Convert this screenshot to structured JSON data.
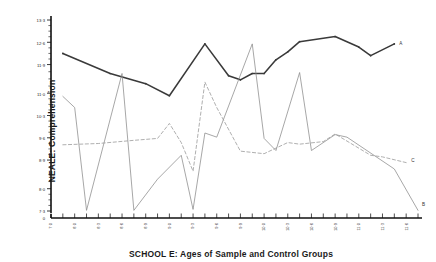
{
  "chart_data": {
    "type": "line",
    "title": "",
    "xlabel": "SCHOOL E: Ages of Sample and Control Groups",
    "ylabel": "NEALE: Comprehension",
    "grid": false,
    "legend_position": "line-end-labels",
    "ylim": [
      7.3,
      13.3
    ],
    "y_break_label": "0",
    "yticks": [
      7.3,
      8.0,
      8.9,
      9.6,
      10.3,
      11.0,
      11.9,
      12.6,
      13.3
    ],
    "ytick_labels": [
      "7·3",
      "8·0",
      "8·9",
      "9·6",
      "10·3",
      "11·0",
      "11·9",
      "12·6",
      "13·3"
    ],
    "y_minor_count": 3,
    "xticks": [
      7.0,
      8.0,
      8.3,
      8.6,
      8.9,
      9.0,
      9.3,
      9.6,
      9.9,
      10.0,
      10.3,
      10.6,
      10.9,
      11.0,
      11.3,
      11.6
    ],
    "xtick_labels": [
      "7·0",
      "8·0",
      "8·3",
      "8·6",
      "8·9",
      "9·0",
      "9·3",
      "9·6",
      "9·9",
      "10·0",
      "10·3",
      "10·6",
      "10·9",
      "11·0",
      "11·3",
      "11·6"
    ],
    "x_index_range": [
      0,
      31
    ],
    "series": [
      {
        "name": "A",
        "label": "A",
        "style": "solid-thick",
        "color": "#3a3a3a",
        "markers": true,
        "points": [
          {
            "i": 1,
            "y": 12.25
          },
          {
            "i": 5,
            "y": 11.62
          },
          {
            "i": 8,
            "y": 11.3
          },
          {
            "i": 10,
            "y": 10.92
          },
          {
            "i": 13,
            "y": 12.55
          },
          {
            "i": 15,
            "y": 11.55
          },
          {
            "i": 16,
            "y": 11.42
          },
          {
            "i": 17,
            "y": 11.62
          },
          {
            "i": 18,
            "y": 11.62
          },
          {
            "i": 19,
            "y": 12.05
          },
          {
            "i": 20,
            "y": 12.3
          },
          {
            "i": 21,
            "y": 12.62
          },
          {
            "i": 24,
            "y": 12.78
          },
          {
            "i": 26,
            "y": 12.45
          },
          {
            "i": 27,
            "y": 12.18
          },
          {
            "i": 29,
            "y": 12.55
          }
        ]
      },
      {
        "name": "B",
        "label": "B",
        "style": "solid-thin",
        "color": "#8a8a8a",
        "markers": false,
        "points": [
          {
            "i": 1,
            "y": 10.9
          },
          {
            "i": 2,
            "y": 10.55
          },
          {
            "i": 3,
            "y": 7.32
          },
          {
            "i": 6,
            "y": 11.62
          },
          {
            "i": 7,
            "y": 7.32
          },
          {
            "i": 9,
            "y": 8.3
          },
          {
            "i": 11,
            "y": 9.05
          },
          {
            "i": 12,
            "y": 7.35
          },
          {
            "i": 13,
            "y": 9.75
          },
          {
            "i": 14,
            "y": 9.62
          },
          {
            "i": 17,
            "y": 12.55
          },
          {
            "i": 18,
            "y": 9.58
          },
          {
            "i": 19,
            "y": 9.2
          },
          {
            "i": 21,
            "y": 11.65
          },
          {
            "i": 22,
            "y": 9.2
          },
          {
            "i": 24,
            "y": 9.7
          },
          {
            "i": 25,
            "y": 9.62
          },
          {
            "i": 29,
            "y": 8.62
          },
          {
            "i": 31,
            "y": 7.32
          }
        ]
      },
      {
        "name": "C",
        "label": "C",
        "style": "dashed",
        "color": "#9a9a9a",
        "markers": false,
        "points": [
          {
            "i": 1,
            "y": 9.38
          },
          {
            "i": 4,
            "y": 9.42
          },
          {
            "i": 7,
            "y": 9.52
          },
          {
            "i": 9,
            "y": 9.58
          },
          {
            "i": 10,
            "y": 10.05
          },
          {
            "i": 11,
            "y": 9.45
          },
          {
            "i": 12,
            "y": 8.55
          },
          {
            "i": 13,
            "y": 11.35
          },
          {
            "i": 14,
            "y": 10.55
          },
          {
            "i": 16,
            "y": 9.18
          },
          {
            "i": 18,
            "y": 9.1
          },
          {
            "i": 20,
            "y": 9.45
          },
          {
            "i": 21,
            "y": 9.4
          },
          {
            "i": 23,
            "y": 9.48
          },
          {
            "i": 24,
            "y": 9.72
          },
          {
            "i": 27,
            "y": 9.05
          },
          {
            "i": 28,
            "y": 9.0
          },
          {
            "i": 30,
            "y": 8.82
          }
        ]
      }
    ]
  }
}
